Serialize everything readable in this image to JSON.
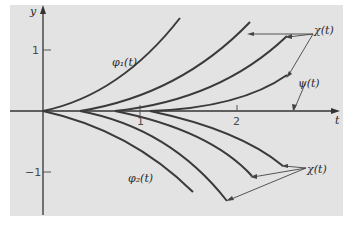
{
  "figure": {
    "background": "#e3e3e3",
    "line_color": "#333333",
    "axes": {
      "x_label": "t",
      "y_label": "y",
      "x_ticks": [
        "1",
        "2"
      ],
      "y_ticks": [
        "1",
        "−1"
      ]
    },
    "labels": {
      "phi1": "φ₁(t)",
      "phi2": "φ₂(t)",
      "chi_upper": "χ(t)",
      "chi_lower": "χ(t)",
      "psi": "ψ(t)"
    }
  }
}
